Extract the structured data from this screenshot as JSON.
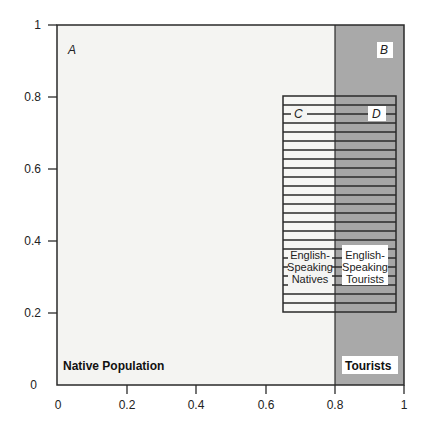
{
  "figure": {
    "region_labels": {
      "A": "A",
      "B": "B",
      "C": "C",
      "D": "D"
    },
    "region_names": {
      "native": "Native Population",
      "tourists": "Tourists",
      "english_natives": [
        "English-",
        "Speaking",
        "Natives"
      ],
      "english_tourists": [
        "English-",
        "Speaking",
        "Tourists"
      ]
    },
    "x_ticks": [
      "0",
      "0.2",
      "0.4",
      "0.6",
      "0.8",
      "1"
    ],
    "y_ticks": [
      "0",
      "0.2",
      "0.4",
      "0.6",
      "0.8",
      "1"
    ],
    "colors": {
      "native_fill": "#f4f4f2",
      "tourist_fill": "#a9a9a9",
      "line": "#2a2a2a",
      "label_bg": "#ffffff"
    }
  },
  "chart_data": {
    "type": "diagram",
    "title": "",
    "xlabel": "",
    "ylabel": "",
    "xlim": [
      0,
      1
    ],
    "ylim": [
      0,
      1
    ],
    "x_ticks": [
      0,
      0.2,
      0.4,
      0.6,
      0.8,
      1
    ],
    "y_ticks": [
      0,
      0.2,
      0.4,
      0.6,
      0.8,
      1
    ],
    "regions": [
      {
        "name": "Native Population",
        "label": "A",
        "x": [
          0,
          0.8
        ],
        "y": [
          0,
          1
        ],
        "fill": "light"
      },
      {
        "name": "Tourists",
        "label": "B",
        "x": [
          0.8,
          1
        ],
        "y": [
          0,
          1
        ],
        "fill": "gray"
      },
      {
        "name": "English-Speaking Natives",
        "label": "C",
        "x": [
          0.65,
          0.8
        ],
        "y": [
          0.2,
          0.8
        ],
        "fill": "hatched"
      },
      {
        "name": "English-Speaking Tourists",
        "label": "D",
        "x": [
          0.8,
          0.97
        ],
        "y": [
          0.2,
          0.8
        ],
        "fill": "hatched-gray"
      }
    ],
    "hatch_rows": 24
  }
}
